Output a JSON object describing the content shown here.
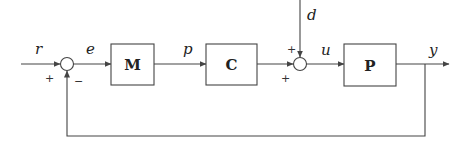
{
  "diagram": {
    "type": "feedback-control-block-diagram",
    "signals": {
      "reference": "r",
      "error": "e",
      "m_output": "p",
      "disturbance": "d",
      "control_input": "u",
      "output": "y"
    },
    "blocks": [
      {
        "id": "M",
        "label": "M"
      },
      {
        "id": "C",
        "label": "C"
      },
      {
        "id": "P",
        "label": "P"
      }
    ],
    "summing_junctions": [
      {
        "id": "sum1",
        "signs": {
          "reference_input": "+",
          "feedback_input": "−"
        }
      },
      {
        "id": "sum2",
        "signs": {
          "disturbance_input": "+",
          "controller_input": "+"
        }
      }
    ],
    "colors": {
      "stroke": "#444444",
      "text": "#222222",
      "background": "#ffffff"
    }
  }
}
